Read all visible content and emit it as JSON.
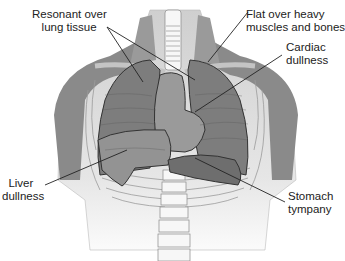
{
  "labels": {
    "resonant": "Resonant over\n   lung tissue",
    "flat": "Flat over heavy\nmuscles and bones",
    "cardiac": "Cardiac\ndullness",
    "liver": "  Liver\ndullness",
    "stomach": "Stomach\ntympany"
  },
  "colors": {
    "muscle": "#8a8a8a",
    "lung": "#7d7d7d",
    "heart": "#9a9a9a",
    "liver": "#939393",
    "stomach": "#6e6e6e",
    "skin": "#d9d9d9",
    "bone": "#f4f4f4",
    "outline": "#333333"
  }
}
